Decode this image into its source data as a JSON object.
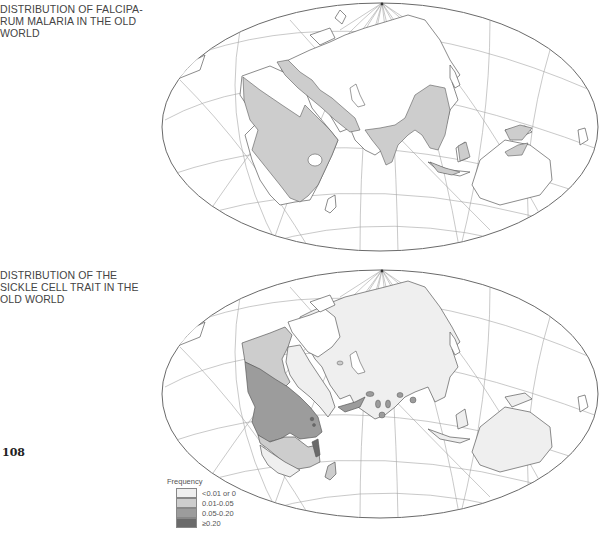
{
  "page": {
    "number": "108"
  },
  "figures": [
    {
      "id": "falciparum",
      "caption_lines": [
        "DISTRIBUTION OF FALCIPA-",
        "RUM MALARIA IN THE OLD",
        "WORLD"
      ],
      "map": {
        "projection": "oblique equal-area (Aitoff-like) world map",
        "shaded_regions": [
          "tropical Africa",
          "Mediterranean coast",
          "Middle East",
          "Indian subcontinent",
          "Southeast Asia",
          "Indonesia",
          "New Guinea",
          "Madagascar"
        ],
        "colors": {
          "fill": "#cfcfcf",
          "outline": "#555555",
          "grid": "#9a9a9a"
        }
      }
    },
    {
      "id": "sickle_cell",
      "caption_lines": [
        "DISTRIBUTION OF THE",
        "SICKLE CELL TRAIT IN THE",
        "OLD WORLD"
      ],
      "map": {
        "projection": "oblique equal-area (Aitoff-like) world map",
        "colors": {
          "outline": "#555555",
          "grid": "#9a9a9a"
        }
      },
      "legend": {
        "title": "Frequency",
        "items": [
          {
            "label": "<0.01 or 0",
            "color": "#efefef"
          },
          {
            "label": "0.01-0.05",
            "color": "#cdcdcd"
          },
          {
            "label": "0.05-0.20",
            "color": "#9c9c9c"
          },
          {
            "label": "≥0.20",
            "color": "#6a6a6a"
          }
        ]
      }
    }
  ]
}
